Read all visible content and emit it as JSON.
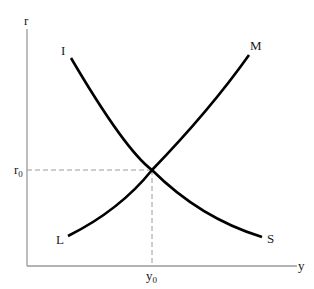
{
  "diagram": {
    "type": "economics-curves",
    "axes": {
      "x_label": "y",
      "y_label": "r",
      "color": "#9a9a9a"
    },
    "equilibrium": {
      "r_label": "r",
      "r_sub": "0",
      "y_label": "y",
      "y_sub": "0"
    },
    "curves": [
      {
        "name": "IS",
        "start_label": "I",
        "end_label": "S",
        "color": "#000000"
      },
      {
        "name": "LM",
        "start_label": "L",
        "end_label": "M",
        "color": "#000000"
      }
    ],
    "guide_color": "#9a9a9a"
  }
}
